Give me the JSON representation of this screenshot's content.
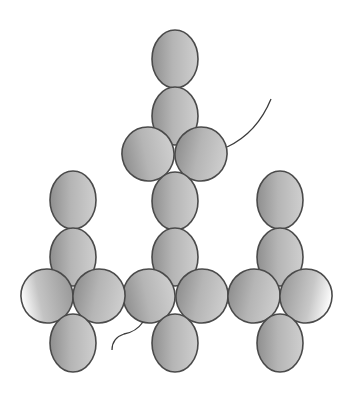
{
  "diagram": {
    "title": "",
    "type": "beadwork-pattern",
    "background": "#ffffff",
    "bead_color_light": "#c9c9c9",
    "bead_color_dark": "#8a8a8a",
    "bead_outline": "#4a4a4a",
    "thread_color": "#3c3c3c",
    "beads": [
      {
        "id": "center-top-1",
        "shape": "vertical",
        "cx": 175,
        "cy": 59,
        "rx": 23,
        "ry": 29
      },
      {
        "id": "center-top-2",
        "shape": "vertical",
        "cx": 175,
        "cy": 116,
        "rx": 23,
        "ry": 29
      },
      {
        "id": "center-upper-left",
        "shape": "horizontal",
        "cx": 148,
        "cy": 154,
        "rx": 26,
        "ry": 27
      },
      {
        "id": "center-upper-right",
        "shape": "horizontal",
        "cx": 201,
        "cy": 154,
        "rx": 26,
        "ry": 27
      },
      {
        "id": "center-mid-1",
        "shape": "vertical",
        "cx": 175,
        "cy": 201,
        "rx": 23,
        "ry": 29
      },
      {
        "id": "center-mid-2",
        "shape": "vertical",
        "cx": 175,
        "cy": 257,
        "rx": 23,
        "ry": 29
      },
      {
        "id": "center-cross-left",
        "shape": "horizontal",
        "cx": 149,
        "cy": 296,
        "rx": 26,
        "ry": 27
      },
      {
        "id": "center-cross-right",
        "shape": "horizontal",
        "cx": 202,
        "cy": 296,
        "rx": 26,
        "ry": 27
      },
      {
        "id": "center-bottom",
        "shape": "vertical",
        "cx": 175,
        "cy": 343,
        "rx": 23,
        "ry": 29
      },
      {
        "id": "left-top-1",
        "shape": "vertical",
        "cx": 73,
        "cy": 200,
        "rx": 23,
        "ry": 29
      },
      {
        "id": "left-top-2",
        "shape": "vertical",
        "cx": 73,
        "cy": 257,
        "rx": 23,
        "ry": 29
      },
      {
        "id": "left-cross-left",
        "shape": "horizontal",
        "cx": 47,
        "cy": 296,
        "rx": 26,
        "ry": 27
      },
      {
        "id": "left-cross-right",
        "shape": "horizontal",
        "cx": 99,
        "cy": 296,
        "rx": 26,
        "ry": 27
      },
      {
        "id": "left-bottom",
        "shape": "vertical",
        "cx": 73,
        "cy": 343,
        "rx": 23,
        "ry": 29
      },
      {
        "id": "right-top-1",
        "shape": "vertical",
        "cx": 280,
        "cy": 200,
        "rx": 23,
        "ry": 29
      },
      {
        "id": "right-top-2",
        "shape": "vertical",
        "cx": 280,
        "cy": 257,
        "rx": 23,
        "ry": 29
      },
      {
        "id": "right-cross-left",
        "shape": "horizontal",
        "cx": 254,
        "cy": 296,
        "rx": 26,
        "ry": 27
      },
      {
        "id": "right-cross-right",
        "shape": "horizontal",
        "cx": 306,
        "cy": 296,
        "rx": 26,
        "ry": 27
      },
      {
        "id": "right-bottom",
        "shape": "vertical",
        "cx": 280,
        "cy": 343,
        "rx": 23,
        "ry": 29
      }
    ],
    "threads": [
      {
        "id": "thread-upper-right-tail",
        "path": "M227,147 Q257,133 271,99"
      },
      {
        "id": "thread-lower-left-tail",
        "path": "M143,322 Q136,332 124,334 Q112,338 112,350"
      }
    ],
    "links": [
      {
        "id": "link-left-center-top",
        "path": "M124,289 L124,289"
      },
      {
        "id": "link-left-center-bottom",
        "path": "M118,303 L130,303"
      },
      {
        "id": "link-center-right-top",
        "path": "M222,289 L232,289"
      },
      {
        "id": "link-center-right-bottom",
        "path": "M222,303 L232,303"
      }
    ]
  }
}
